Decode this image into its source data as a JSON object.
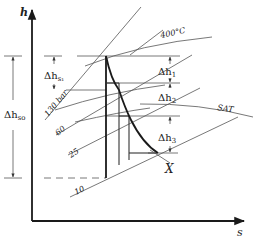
{
  "diagram": {
    "axes": {
      "y_label": "h",
      "x_label": "s"
    },
    "isobars": [
      {
        "label": "130 bar"
      },
      {
        "label": "60"
      },
      {
        "label": "25"
      },
      {
        "label": "10"
      }
    ],
    "isotherm_label": "400°C",
    "saturation_label": "SAT",
    "end_point_label": "X",
    "dimensions": {
      "total_isentropic": {
        "symbol": "Δh",
        "subscript": "so"
      },
      "first_stage_isentropic": {
        "symbol": "Δh",
        "subscript": "s₁"
      },
      "stage_1": {
        "symbol": "Δh",
        "subscript": "1"
      },
      "stage_2": {
        "symbol": "Δh",
        "subscript": "2"
      },
      "stage_3": {
        "symbol": "Δh",
        "subscript": "3"
      }
    }
  }
}
